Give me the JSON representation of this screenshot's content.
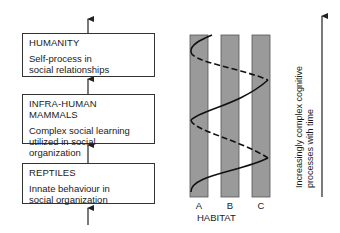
{
  "stages": [
    {
      "title": "HUMANITY",
      "description_lines": [
        "Self-process in",
        "social relationships"
      ]
    },
    {
      "title": "INFRA-HUMAN MAMMALS",
      "description_lines": [
        "Complex social learning",
        "utilized in social",
        "organization"
      ]
    },
    {
      "title": "REPTILES",
      "description_lines": [
        "Innate behaviour in",
        "social organization"
      ]
    }
  ],
  "habitat": {
    "axis_title": "HABITAT",
    "bars": [
      {
        "label": "A"
      },
      {
        "label": "B"
      },
      {
        "label": "C"
      }
    ],
    "bar_color": "#9a9a9a"
  },
  "time_axis": {
    "label_line1": "Increasingly complex cognitive",
    "label_line2": "processes with time"
  }
}
